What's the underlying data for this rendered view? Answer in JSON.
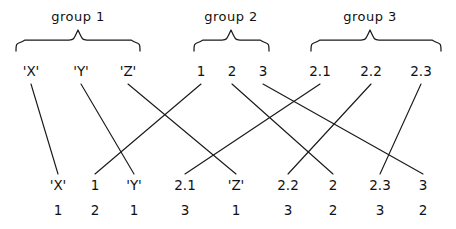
{
  "diagram": {
    "type": "mapping-diagram",
    "title_visible": false,
    "stroke_color": "#1a1a1a",
    "text_color": "#111111",
    "background": "#ffffff",
    "groups": [
      {
        "name": "group-1",
        "label": "group 1",
        "label_x": 78,
        "label_y": 16,
        "brace_left": 16,
        "brace_right": 140,
        "brace_y": 38,
        "brace_peak_x": 78
      },
      {
        "name": "group-2",
        "label": "group 2",
        "label_x": 231,
        "label_y": 16,
        "brace_left": 194,
        "brace_right": 269,
        "brace_y": 38,
        "brace_peak_x": 231
      },
      {
        "name": "group-3",
        "label": "group 3",
        "label_x": 370,
        "label_y": 16,
        "brace_left": 311,
        "brace_right": 441,
        "brace_y": 38,
        "brace_peak_x": 370
      }
    ],
    "top_row": {
      "y": 78,
      "items": [
        {
          "id": "t0",
          "text": "'X'",
          "x": 31,
          "group": "group-1"
        },
        {
          "id": "t1",
          "text": "'Y'",
          "x": 81,
          "group": "group-1"
        },
        {
          "id": "t2",
          "text": "'Z'",
          "x": 128,
          "group": "group-1"
        },
        {
          "id": "t3",
          "text": "1",
          "x": 201,
          "group": "group-2"
        },
        {
          "id": "t4",
          "text": "2",
          "x": 232,
          "group": "group-2"
        },
        {
          "id": "t5",
          "text": "3",
          "x": 263,
          "group": "group-2"
        },
        {
          "id": "t6",
          "text": "2.1",
          "x": 320,
          "group": "group-3"
        },
        {
          "id": "t7",
          "text": "2.2",
          "x": 371,
          "group": "group-3"
        },
        {
          "id": "t8",
          "text": "2.3",
          "x": 421,
          "group": "group-3"
        }
      ]
    },
    "bottom_row": {
      "y_primary": 188,
      "y_secondary": 213,
      "pairs": [
        {
          "id": "b0",
          "primary": "'X'",
          "secondary": "1",
          "primary_x": 58,
          "secondary_x": 58,
          "apex_x": 58
        },
        {
          "id": "b1",
          "primary": "1",
          "secondary": "2",
          "primary_x": 95,
          "secondary_x": 95,
          "apex_x": 95
        },
        {
          "id": "b2",
          "primary": "'Y'",
          "secondary": "1",
          "primary_x": 134,
          "secondary_x": 134,
          "apex_x": 134
        },
        {
          "id": "b3",
          "primary": "2.1",
          "secondary": "3",
          "primary_x": 185,
          "secondary_x": 185,
          "apex_x": 185
        },
        {
          "id": "b4",
          "primary": "'Z'",
          "secondary": "1",
          "primary_x": 236,
          "secondary_x": 236,
          "apex_x": 236
        },
        {
          "id": "b5",
          "primary": "2.2",
          "secondary": "3",
          "primary_x": 288,
          "secondary_x": 288,
          "apex_x": 288
        },
        {
          "id": "b6",
          "primary": "2",
          "secondary": "2",
          "primary_x": 333,
          "secondary_x": 333,
          "apex_x": 333
        },
        {
          "id": "b7",
          "primary": "2.3",
          "secondary": "3",
          "primary_x": 380,
          "secondary_x": 380,
          "apex_x": 380
        },
        {
          "id": "b8",
          "primary": "3",
          "secondary": "2",
          "primary_x": 423,
          "secondary_x": 423,
          "apex_x": 423
        }
      ]
    },
    "edges": [
      {
        "id": "e0",
        "from": "t0",
        "to": "b0",
        "from_x": 31,
        "to_x": 58,
        "label": "'X' to pair 1"
      },
      {
        "id": "e1",
        "from": "t1",
        "to": "b2",
        "from_x": 81,
        "to_x": 134,
        "label": "'Y' to pair 3"
      },
      {
        "id": "e2",
        "from": "t2",
        "to": "b4",
        "from_x": 128,
        "to_x": 236,
        "label": "'Z' to pair 5"
      },
      {
        "id": "e3",
        "from": "t3",
        "to": "b1",
        "from_x": 201,
        "to_x": 95,
        "label": "1 to pair 2"
      },
      {
        "id": "e4",
        "from": "t4",
        "to": "b6",
        "from_x": 232,
        "to_x": 333,
        "label": "2 to pair 7"
      },
      {
        "id": "e5",
        "from": "t5",
        "to": "b8",
        "from_x": 263,
        "to_x": 423,
        "label": "3 to pair 9"
      },
      {
        "id": "e6",
        "from": "t6",
        "to": "b3",
        "from_x": 320,
        "to_x": 185,
        "label": "2.1 to pair 4"
      },
      {
        "id": "e7",
        "from": "t7",
        "to": "b5",
        "from_x": 371,
        "to_x": 288,
        "label": "2.2 to pair 6"
      },
      {
        "id": "e8",
        "from": "t8",
        "to": "b7",
        "from_x": 421,
        "to_x": 380,
        "label": "2.3 to pair 8"
      }
    ]
  }
}
